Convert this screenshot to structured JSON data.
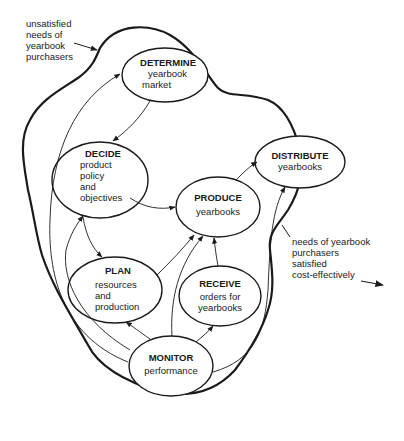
{
  "diagram": {
    "type": "process-flow",
    "boundary_label_outside": [
      "unsatisfied",
      "needs of",
      "yearbook",
      "purchasers"
    ],
    "boundary_label_output": [
      "needs of yearbook",
      "purchasers",
      "satisfied",
      "cost-effectively"
    ],
    "nodes": [
      {
        "id": "determine",
        "title": "DETERMINE",
        "lines": [
          "yearbook",
          "market"
        ]
      },
      {
        "id": "decide",
        "title": "DECIDE",
        "lines": [
          "product",
          "policy",
          "and",
          "objectives"
        ]
      },
      {
        "id": "produce",
        "title": "PRODUCE",
        "lines": [
          "yearbooks"
        ]
      },
      {
        "id": "distribute",
        "title": "DISTRIBUTE",
        "lines": [
          "yearbooks"
        ]
      },
      {
        "id": "plan",
        "title": "PLAN",
        "lines": [
          "resources",
          "and",
          "production"
        ]
      },
      {
        "id": "receive",
        "title": "RECEIVE",
        "lines": [
          "orders for",
          "yearbooks"
        ]
      },
      {
        "id": "monitor",
        "title": "MONITOR",
        "lines": [
          "performance"
        ]
      }
    ],
    "edges": [
      {
        "from": "determine",
        "to": "decide"
      },
      {
        "from": "decide",
        "to": "produce"
      },
      {
        "from": "decide",
        "to": "plan"
      },
      {
        "from": "produce",
        "to": "distribute"
      },
      {
        "from": "plan",
        "to": "produce"
      },
      {
        "from": "receive",
        "to": "produce"
      },
      {
        "from": "monitor",
        "to": "plan"
      },
      {
        "from": "monitor",
        "to": "receive"
      },
      {
        "from": "monitor",
        "to": "produce"
      },
      {
        "from": "monitor",
        "to": "distribute"
      },
      {
        "from": "monitor",
        "to": "decide"
      },
      {
        "from": "monitor",
        "to": "determine"
      }
    ]
  }
}
